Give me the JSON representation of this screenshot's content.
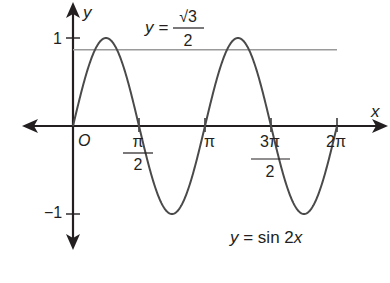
{
  "chart_data": {
    "type": "line",
    "title": "",
    "xlabel": "x",
    "ylabel": "y",
    "xlim": [
      0,
      6.2832
    ],
    "ylim": [
      -1,
      1
    ],
    "grid": false,
    "series": [
      {
        "name": "y = sin 2x",
        "function": "sin(2x)",
        "x_range": [
          0,
          6.2832
        ],
        "color": "#4a4a4a"
      },
      {
        "name": "y = √3/2",
        "function": "constant",
        "value": 0.866,
        "x_range": [
          0,
          6.2832
        ],
        "color": "#9a9a9a"
      }
    ],
    "x_ticks": [
      {
        "value": 1.5708,
        "label_num": "π",
        "label_den": "2"
      },
      {
        "value": 3.1416,
        "label": "π"
      },
      {
        "value": 4.7124,
        "label_num": "3π",
        "label_den": "2"
      },
      {
        "value": 6.2832,
        "label": "2π"
      }
    ],
    "y_ticks": [
      {
        "value": 1,
        "label": "1"
      },
      {
        "value": -1,
        "label": "−1"
      }
    ],
    "annotations": {
      "origin": "O",
      "hline_label_prefix": "y =",
      "hline_label_num": "√3",
      "hline_label_den": "2",
      "curve_label_y": "y",
      "curve_label_mid": " = sin 2",
      "curve_label_x": "x"
    }
  }
}
